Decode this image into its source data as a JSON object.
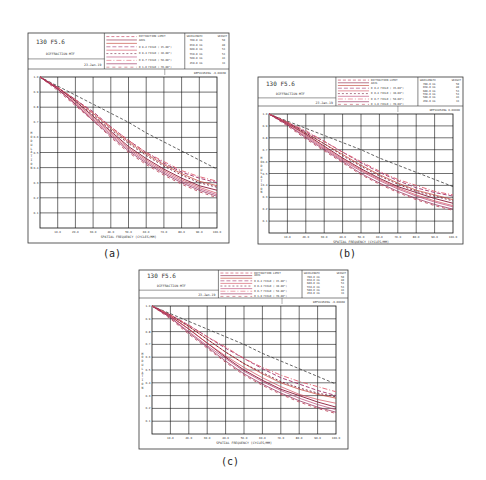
{
  "panels": [
    {
      "id": "a",
      "caption": "(a)",
      "title": "130 F5.6",
      "subtitle": "DIFFRACTION MTF",
      "date": "23-Jan-19",
      "defocusing": "DEFOCUSING -0.00030",
      "box": {
        "x": 28,
        "y": 33,
        "w": 201,
        "h": 210
      },
      "plot": {
        "x": 40,
        "y": 77,
        "w": 177,
        "h": 151
      },
      "caption_pos": {
        "x": 112,
        "y": 247
      }
    },
    {
      "id": "b",
      "caption": "(b)",
      "title": "130 F5.6",
      "subtitle": "DIFFRACTION MTF",
      "date": "23-Jan-19",
      "defocusing": "DEFOCUSING 0.00000",
      "box": {
        "x": 258,
        "y": 77,
        "w": 205,
        "h": 167
      },
      "plot": {
        "x": 269,
        "y": 114,
        "w": 184,
        "h": 119
      },
      "caption_pos": {
        "x": 347,
        "y": 247
      }
    },
    {
      "id": "c",
      "caption": "(c)",
      "title": "130 F5.6",
      "subtitle": "DIFFRACTION MTF",
      "date": "23-Jan-19",
      "defocusing": "DEFOCUSING -0.00060",
      "box": {
        "x": 139,
        "y": 270,
        "w": 209,
        "h": 179
      },
      "plot": {
        "x": 152,
        "y": 306,
        "w": 184,
        "h": 128
      },
      "caption_pos": {
        "x": 230,
        "y": 455
      }
    }
  ],
  "legend": {
    "entries": [
      "DIFFRACTION LIMIT",
      "AXIS",
      "T",
      "R 0.2 FIELD ( 15.00°)",
      "T",
      "R 0.4 FIELD ( 30.00°)",
      "T",
      "R 0.7 FIELD ( 50.00°)",
      "T",
      "R 1.0 FIELD ( 70.00°)"
    ],
    "wavelength_header": "WAVELENGTH",
    "weight_header": "WEIGHT",
    "wavelengths": [
      {
        "nm": "700.0 nm",
        "weight": "50"
      },
      {
        "nm": "650.0 nm",
        "weight": "80"
      },
      {
        "nm": "600.0 nm",
        "weight": "53"
      },
      {
        "nm": "550.0 nm",
        "weight": "53"
      },
      {
        "nm": "500.0 nm",
        "weight": "43"
      },
      {
        "nm": "450.0 nm",
        "weight": "33"
      }
    ]
  },
  "colors": {
    "diffraction": "#222222",
    "curves": [
      "#8b1a3a",
      "#c0392b",
      "#a0306a",
      "#d24a5a",
      "#7a2040",
      "#b84070",
      "#e06070",
      "#902050",
      "#c05060"
    ],
    "grid": "#111111",
    "frame": "#333333"
  },
  "chart_data": [
    {
      "type": "line",
      "title": "130 F5.6 DIFFRACTION MTF (a)",
      "xlabel": "SPATIAL FREQUENCY (CYCLES/MM)",
      "ylabel": "MODULATION",
      "x": [
        0,
        10,
        20,
        30,
        40,
        50,
        60,
        70,
        80,
        90,
        100
      ],
      "xticks": [
        "10.0",
        "20.0",
        "30.0",
        "40.0",
        "50.0",
        "60.0",
        "70.0",
        "80.0",
        "90.0",
        "100.0"
      ],
      "yticks": [
        "0.1",
        "0.2",
        "0.3",
        "0.4",
        "0.5",
        "0.6",
        "0.7",
        "0.8",
        "0.9",
        "1.0"
      ],
      "xlim": [
        0,
        100
      ],
      "ylim": [
        0,
        1.0
      ],
      "grid": true,
      "series": [
        {
          "name": "DIFFRACTION LIMIT",
          "dash": "3,2",
          "values": [
            1.0,
            0.94,
            0.88,
            0.82,
            0.76,
            0.7,
            0.63,
            0.57,
            0.51,
            0.45,
            0.39
          ]
        },
        {
          "name": "AXIS",
          "dash": "",
          "values": [
            1.0,
            0.93,
            0.84,
            0.74,
            0.64,
            0.54,
            0.46,
            0.39,
            0.33,
            0.28,
            0.25
          ]
        },
        {
          "name": "T 0.2 FIELD",
          "dash": "",
          "values": [
            1.0,
            0.93,
            0.85,
            0.76,
            0.66,
            0.57,
            0.49,
            0.42,
            0.36,
            0.31,
            0.28
          ]
        },
        {
          "name": "R 0.2 FIELD",
          "dash": "4,2",
          "values": [
            1.0,
            0.93,
            0.85,
            0.77,
            0.67,
            0.58,
            0.5,
            0.43,
            0.37,
            0.33,
            0.3
          ]
        },
        {
          "name": "T 0.4 FIELD",
          "dash": "",
          "values": [
            1.0,
            0.92,
            0.83,
            0.73,
            0.63,
            0.53,
            0.45,
            0.38,
            0.32,
            0.27,
            0.23
          ]
        },
        {
          "name": "R 0.4 FIELD",
          "dash": "2,2",
          "values": [
            1.0,
            0.93,
            0.84,
            0.75,
            0.65,
            0.56,
            0.48,
            0.41,
            0.35,
            0.3,
            0.27
          ]
        },
        {
          "name": "T 0.7 FIELD",
          "dash": "",
          "values": [
            1.0,
            0.92,
            0.82,
            0.72,
            0.62,
            0.52,
            0.44,
            0.37,
            0.31,
            0.26,
            0.22
          ]
        },
        {
          "name": "R 0.7 FIELD",
          "dash": "5,2,1,2",
          "values": [
            1.0,
            0.93,
            0.85,
            0.76,
            0.67,
            0.58,
            0.5,
            0.44,
            0.38,
            0.34,
            0.31
          ]
        },
        {
          "name": "T 1.0 FIELD",
          "dash": "",
          "values": [
            1.0,
            0.92,
            0.82,
            0.71,
            0.61,
            0.51,
            0.43,
            0.36,
            0.3,
            0.25,
            0.21
          ]
        },
        {
          "name": "R 1.0 FIELD",
          "dash": "3,3",
          "values": [
            1.0,
            0.91,
            0.81,
            0.71,
            0.6,
            0.5,
            0.42,
            0.35,
            0.29,
            0.24,
            0.2
          ]
        }
      ]
    },
    {
      "type": "line",
      "title": "130 F5.6 DIFFRACTION MTF (b)",
      "xlabel": "SPATIAL FREQUENCY (CYCLES/MM)",
      "ylabel": "MODULATION",
      "x": [
        0,
        10,
        20,
        30,
        40,
        50,
        60,
        70,
        80,
        90,
        100
      ],
      "xticks": [
        "10.0",
        "20.0",
        "30.0",
        "40.0",
        "50.0",
        "60.0",
        "70.0",
        "80.0",
        "90.0",
        "100.0"
      ],
      "yticks": [
        "0.1",
        "0.2",
        "0.3",
        "0.4",
        "0.5",
        "0.6",
        "0.7",
        "0.8",
        "0.9",
        "1.0"
      ],
      "xlim": [
        0,
        100
      ],
      "ylim": [
        0,
        1.0
      ],
      "grid": true,
      "series": [
        {
          "name": "DIFFRACTION LIMIT",
          "dash": "3,2",
          "values": [
            1.0,
            0.94,
            0.88,
            0.82,
            0.76,
            0.7,
            0.63,
            0.57,
            0.51,
            0.45,
            0.39
          ]
        },
        {
          "name": "AXIS",
          "dash": "",
          "values": [
            1.0,
            0.92,
            0.83,
            0.73,
            0.63,
            0.54,
            0.46,
            0.39,
            0.34,
            0.29,
            0.25
          ]
        },
        {
          "name": "T 0.2 FIELD",
          "dash": "",
          "values": [
            1.0,
            0.93,
            0.84,
            0.75,
            0.66,
            0.57,
            0.49,
            0.42,
            0.36,
            0.32,
            0.28
          ]
        },
        {
          "name": "R 0.2 FIELD",
          "dash": "4,2",
          "values": [
            1.0,
            0.93,
            0.85,
            0.77,
            0.68,
            0.59,
            0.51,
            0.44,
            0.38,
            0.34,
            0.31
          ]
        },
        {
          "name": "T 0.4 FIELD",
          "dash": "",
          "values": [
            1.0,
            0.92,
            0.82,
            0.72,
            0.62,
            0.53,
            0.45,
            0.38,
            0.32,
            0.27,
            0.23
          ]
        },
        {
          "name": "R 0.4 FIELD",
          "dash": "2,2",
          "values": [
            1.0,
            0.93,
            0.84,
            0.75,
            0.65,
            0.56,
            0.48,
            0.41,
            0.35,
            0.31,
            0.27
          ]
        },
        {
          "name": "T 0.7 FIELD",
          "dash": "",
          "values": [
            1.0,
            0.91,
            0.81,
            0.71,
            0.61,
            0.52,
            0.44,
            0.37,
            0.31,
            0.26,
            0.22
          ]
        },
        {
          "name": "R 0.7 FIELD",
          "dash": "5,2,1,2",
          "values": [
            1.0,
            0.93,
            0.86,
            0.77,
            0.68,
            0.6,
            0.52,
            0.45,
            0.4,
            0.35,
            0.32
          ]
        },
        {
          "name": "T 1.0 FIELD",
          "dash": "",
          "values": [
            1.0,
            0.91,
            0.8,
            0.7,
            0.6,
            0.5,
            0.42,
            0.35,
            0.29,
            0.24,
            0.2
          ]
        },
        {
          "name": "R 1.0 FIELD",
          "dash": "3,3",
          "values": [
            1.0,
            0.9,
            0.79,
            0.69,
            0.59,
            0.49,
            0.41,
            0.34,
            0.28,
            0.23,
            0.19
          ]
        }
      ]
    },
    {
      "type": "line",
      "title": "130 F5.6 DIFFRACTION MTF (c)",
      "xlabel": "SPATIAL FREQUENCY (CYCLES/MM)",
      "ylabel": "MODULATION",
      "x": [
        0,
        10,
        20,
        30,
        40,
        50,
        60,
        70,
        80,
        90,
        100
      ],
      "xticks": [
        "10.0",
        "20.0",
        "30.0",
        "40.0",
        "50.0",
        "60.0",
        "70.0",
        "80.0",
        "90.0",
        "100.0"
      ],
      "yticks": [
        "0.1",
        "0.2",
        "0.3",
        "0.4",
        "0.5",
        "0.6",
        "0.7",
        "0.8",
        "0.9",
        "1.0"
      ],
      "xlim": [
        0,
        100
      ],
      "ylim": [
        0,
        1.0
      ],
      "grid": true,
      "series": [
        {
          "name": "DIFFRACTION LIMIT",
          "dash": "3,2",
          "values": [
            1.0,
            0.94,
            0.88,
            0.82,
            0.76,
            0.7,
            0.63,
            0.57,
            0.51,
            0.45,
            0.39
          ]
        },
        {
          "name": "AXIS",
          "dash": "",
          "values": [
            1.0,
            0.92,
            0.82,
            0.71,
            0.6,
            0.5,
            0.42,
            0.35,
            0.3,
            0.25,
            0.21
          ]
        },
        {
          "name": "T 0.2 FIELD",
          "dash": "",
          "values": [
            1.0,
            0.93,
            0.84,
            0.74,
            0.64,
            0.55,
            0.47,
            0.4,
            0.35,
            0.31,
            0.28
          ]
        },
        {
          "name": "R 0.2 FIELD",
          "dash": "4,2",
          "values": [
            1.0,
            0.93,
            0.85,
            0.76,
            0.67,
            0.59,
            0.51,
            0.44,
            0.39,
            0.34,
            0.3
          ]
        },
        {
          "name": "T 0.4 FIELD",
          "dash": "",
          "values": [
            1.0,
            0.92,
            0.82,
            0.71,
            0.61,
            0.52,
            0.44,
            0.37,
            0.31,
            0.27,
            0.24
          ]
        },
        {
          "name": "R 0.4 FIELD",
          "dash": "2,2",
          "values": [
            1.0,
            0.93,
            0.84,
            0.74,
            0.64,
            0.55,
            0.48,
            0.41,
            0.36,
            0.32,
            0.29
          ]
        },
        {
          "name": "T 0.7 FIELD",
          "dash": "",
          "values": [
            1.0,
            0.91,
            0.8,
            0.69,
            0.59,
            0.49,
            0.41,
            0.34,
            0.28,
            0.23,
            0.19
          ]
        },
        {
          "name": "R 0.7 FIELD",
          "dash": "5,2,1,2",
          "values": [
            1.0,
            0.93,
            0.85,
            0.76,
            0.68,
            0.59,
            0.52,
            0.46,
            0.41,
            0.37,
            0.33
          ]
        },
        {
          "name": "T 1.0 FIELD",
          "dash": "",
          "values": [
            1.0,
            0.91,
            0.79,
            0.68,
            0.57,
            0.47,
            0.39,
            0.32,
            0.26,
            0.21,
            0.17
          ]
        },
        {
          "name": "R 1.0 FIELD",
          "dash": "3,3",
          "values": [
            1.0,
            0.9,
            0.78,
            0.67,
            0.56,
            0.46,
            0.38,
            0.31,
            0.25,
            0.2,
            0.16
          ]
        }
      ]
    }
  ]
}
